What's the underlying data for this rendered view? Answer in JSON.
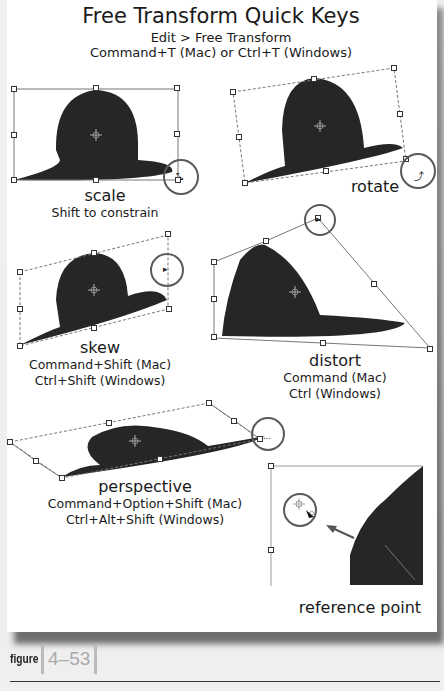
{
  "header": {
    "title": "Free Transform Quick Keys",
    "menu_path": "Edit > Free Transform",
    "shortcut": "Command+T (Mac) or Ctrl+T (Windows)"
  },
  "panels": [
    {
      "id": "scale",
      "name": "scale",
      "keys": [
        "Shift to constrain"
      ],
      "cursor_icon": "scale-cursor-icon"
    },
    {
      "id": "rotate",
      "name": "rotate",
      "keys": [],
      "cursor_icon": "rotate-cursor-icon"
    },
    {
      "id": "skew",
      "name": "skew",
      "keys": [
        "Command+Shift (Mac)",
        "Ctrl+Shift (Windows)"
      ],
      "cursor_icon": "skew-cursor-icon"
    },
    {
      "id": "distort",
      "name": "distort",
      "keys": [
        "Command (Mac)",
        "Ctrl (Windows)"
      ],
      "cursor_icon": "distort-cursor-icon"
    },
    {
      "id": "perspective",
      "name": "perspective",
      "keys": [
        "Command+Option+Shift (Mac)",
        "Ctrl+Alt+Shift (Windows)"
      ],
      "cursor_icon": "perspective-cursor-icon"
    },
    {
      "id": "reference",
      "name": "reference point",
      "keys": [],
      "cursor_icon": "reference-point-cursor-icon"
    }
  ],
  "caption": {
    "label": "figure",
    "number": "4–53"
  },
  "colors": {
    "circle": "#5a5a5a",
    "bbox_line": "#777777",
    "hat": "#1f1f1f",
    "page_bg": "#efefef"
  }
}
